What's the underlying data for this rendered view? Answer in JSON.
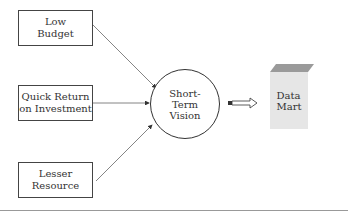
{
  "diagram": {
    "inputs": [
      {
        "label": "Low\nBudget"
      },
      {
        "label": "Quick Return\non Investment"
      },
      {
        "label": "Lesser\nResource"
      }
    ],
    "center": {
      "label": "Short-\nTerm\nVision"
    },
    "output": {
      "label": "Data\nMart"
    },
    "colors": {
      "line": "#555555",
      "cube_front": "#e6e6e6",
      "cube_top": "#9a9a9a"
    }
  }
}
